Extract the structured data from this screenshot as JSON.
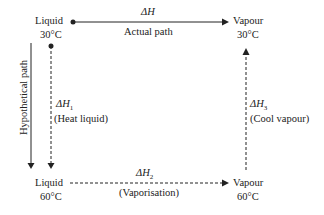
{
  "nodes": {
    "top_left": {
      "state": "Liquid",
      "temp": "30°C"
    },
    "top_right": {
      "state": "Vapour",
      "temp": "30°C"
    },
    "bottom_left": {
      "state": "Liquid",
      "temp": "60°C"
    },
    "bottom_right": {
      "state": "Vapour",
      "temp": "60°C"
    }
  },
  "edges": {
    "actual": {
      "symbol": "ΔH",
      "label": "Actual path"
    },
    "heat_liquid": {
      "symbol": "ΔH",
      "sub": "1",
      "label": "(Heat liquid)"
    },
    "vaporisation": {
      "symbol": "ΔH",
      "sub": "2",
      "label": "(Vaporisation)"
    },
    "cool_vapour": {
      "symbol": "ΔH",
      "sub": "3",
      "label": "(Cool vapour)"
    }
  },
  "side_label": "Hypothetical path",
  "colors": {
    "line": "#222222",
    "background": "#ffffff"
  }
}
